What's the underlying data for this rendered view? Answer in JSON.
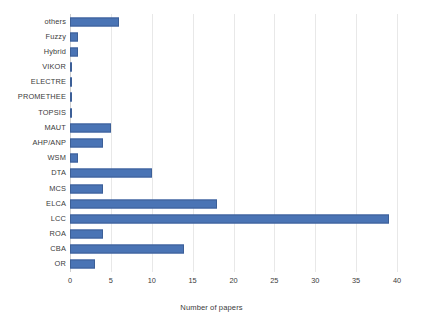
{
  "chart_data": {
    "type": "bar",
    "orientation": "horizontal",
    "title": "",
    "subtitle": "",
    "xlabel": "Number of papers",
    "ylabel": "",
    "xlim": [
      0,
      40
    ],
    "ylim": null,
    "xticks": [
      0,
      5,
      10,
      15,
      20,
      25,
      30,
      35,
      40
    ],
    "xtick_labels": [
      "0",
      "5",
      "10",
      "15",
      "20",
      "25",
      "30",
      "35",
      "40"
    ],
    "grid": "vertical",
    "legend": null,
    "legend_position": "none",
    "bar_color": "#4a74b5",
    "bar_border_color": "#3c5f97",
    "grid_color": "#e8e8e8",
    "categories": [
      "others",
      "Fuzzy",
      "Hybrid",
      "VIKOR",
      "ELECTRE",
      "PROMETHEE",
      "TOPSIS",
      "MAUT",
      "AHP/ANP",
      "WSM",
      "DTA",
      "MCS",
      "ELCA",
      "LCC",
      "ROA",
      "CBA",
      "OR"
    ],
    "values": [
      6,
      1,
      1,
      0.2,
      0.2,
      0.2,
      0.2,
      5,
      4,
      1,
      10,
      4,
      18,
      39,
      4,
      14,
      3
    ]
  }
}
